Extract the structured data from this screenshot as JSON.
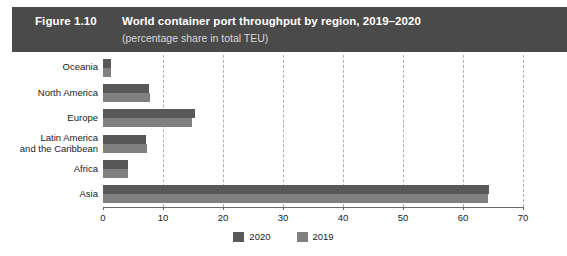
{
  "header": {
    "figure_number": "Figure 1.10",
    "title": "World container port throughput by region, 2019–2020",
    "subtitle": "(percentage share in total TEU)",
    "band_color": "#4a4a4a",
    "text_color": "#ffffff",
    "subtitle_color": "#d8d8d8"
  },
  "legend": {
    "position": "bottom-center",
    "items": [
      {
        "label": "2020",
        "color": "#585858"
      },
      {
        "label": "2019",
        "color": "#808080"
      }
    ]
  },
  "chart_data": {
    "type": "bar",
    "orientation": "horizontal",
    "title": "World container port throughput by region, 2019–2020",
    "subtitle": "(percentage share in total TEU)",
    "xlabel": "",
    "ylabel": "",
    "xlim": [
      0,
      70
    ],
    "xticks": [
      0,
      10,
      20,
      30,
      40,
      50,
      60,
      70
    ],
    "xtick_labels": [
      "0",
      "10",
      "20",
      "30",
      "40",
      "50",
      "60",
      "70"
    ],
    "grid": "vertical-dashed",
    "categories": [
      "Oceania",
      "North America",
      "Europe",
      "Latin America\nand the Caribbean",
      "Africa",
      "Asia"
    ],
    "category_labels": [
      [
        "Oceania"
      ],
      [
        "North America"
      ],
      [
        "Europe"
      ],
      [
        "Latin America",
        "and the Caribbean"
      ],
      [
        "Africa"
      ],
      [
        "Asia"
      ]
    ],
    "series": [
      {
        "name": "2020",
        "color": "#585858",
        "values": [
          1.3,
          7.6,
          15.4,
          7.2,
          4.1,
          64.4
        ]
      },
      {
        "name": "2019",
        "color": "#808080",
        "values": [
          1.4,
          7.9,
          14.9,
          7.4,
          4.2,
          64.2
        ]
      }
    ]
  }
}
